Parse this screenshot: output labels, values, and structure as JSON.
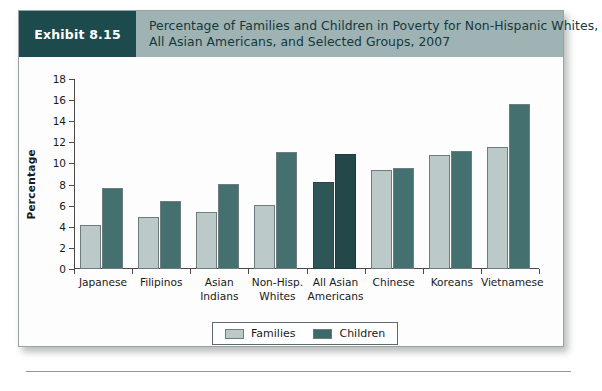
{
  "exhibit": {
    "tag": "Exhibit 8.15",
    "title_line1": "Percentage of Families and Children in Poverty for Non-Hispanic Whites,",
    "title_line2": "All Asian Americans, and Selected Groups, 2007"
  },
  "colors": {
    "tag_background": "#1d4a4c",
    "header_background": "#9fb2b4",
    "families_bar": "#bbc9c8",
    "children_bar": "#44706f",
    "families_bar_highlight": "#2f5657",
    "children_bar_highlight": "#24474a",
    "axis": "#4a4a4a"
  },
  "chart_data": {
    "type": "bar",
    "title": "Percentage of Families and Children in Poverty for Non-Hispanic Whites, All Asian Americans, and Selected Groups, 2007",
    "xlabel": "",
    "ylabel": "Percentage",
    "ylim": [
      0,
      18
    ],
    "yticks": [
      0,
      2,
      4,
      6,
      8,
      10,
      12,
      14,
      16,
      18
    ],
    "grid": false,
    "legend_position": "bottom-center",
    "highlight_category": "All Asian Americans",
    "categories": [
      "Japanese",
      "Filipinos",
      "Asian Indians",
      "Non-Hisp. Whites",
      "All Asian Americans",
      "Chinese",
      "Koreans",
      "Vietnamese"
    ],
    "category_lines": [
      [
        "Japanese"
      ],
      [
        "Filipinos"
      ],
      [
        "Asian",
        "Indians"
      ],
      [
        "Non-Hisp.",
        "Whites"
      ],
      [
        "All Asian",
        "Americans"
      ],
      [
        "Chinese"
      ],
      [
        "Koreans"
      ],
      [
        "Vietnamese"
      ]
    ],
    "series": [
      {
        "name": "Families",
        "values": [
          4.2,
          4.9,
          5.4,
          6.1,
          8.2,
          9.4,
          10.8,
          11.6
        ]
      },
      {
        "name": "Children",
        "values": [
          7.7,
          6.4,
          8.1,
          11.1,
          10.9,
          9.6,
          11.2,
          15.6
        ]
      }
    ]
  }
}
